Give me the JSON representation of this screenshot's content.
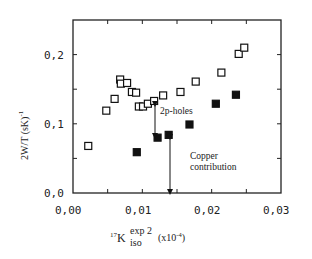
{
  "chart_data": {
    "type": "scatter",
    "title": "",
    "xlabel": "17K_iso^exp 2 (x10^-4)",
    "ylabel": "2W/T (sK)^-1",
    "xlim": [
      0.0,
      0.03
    ],
    "ylim": [
      0.0,
      0.25
    ],
    "x_ticks": [
      "0,00",
      "0,01",
      "0,02",
      "0,03"
    ],
    "y_ticks": [
      "0,0",
      "0,1",
      "0,2"
    ],
    "grid": false,
    "legend": null,
    "series": [
      {
        "name": "open squares",
        "marker": "open-square",
        "points": [
          [
            0.0022,
            0.068
          ],
          [
            0.0048,
            0.119
          ],
          [
            0.006,
            0.136
          ],
          [
            0.0068,
            0.164
          ],
          [
            0.0069,
            0.158
          ],
          [
            0.0078,
            0.159
          ],
          [
            0.0085,
            0.146
          ],
          [
            0.0091,
            0.145
          ],
          [
            0.0095,
            0.125
          ],
          [
            0.0101,
            0.125
          ],
          [
            0.0108,
            0.129
          ],
          [
            0.0117,
            0.133
          ],
          [
            0.013,
            0.141
          ],
          [
            0.0155,
            0.146
          ],
          [
            0.0177,
            0.161
          ],
          [
            0.0214,
            0.174
          ],
          [
            0.0239,
            0.201
          ],
          [
            0.0247,
            0.21
          ]
        ]
      },
      {
        "name": "filled squares",
        "marker": "filled-square",
        "points": [
          [
            0.0092,
            0.059
          ],
          [
            0.0122,
            0.08
          ],
          [
            0.0138,
            0.084
          ],
          [
            0.0168,
            0.099
          ],
          [
            0.0206,
            0.129
          ],
          [
            0.0235,
            0.142
          ]
        ]
      }
    ],
    "annotations": [
      {
        "text": "2p-holes",
        "arrow": {
          "x": 0.0118,
          "y_from": 0.132,
          "y_to": 0.082
        }
      },
      {
        "text": "Copper contribution",
        "lines": [
          "Copper",
          "contribution"
        ],
        "arrow": {
          "x": 0.014,
          "y_from": 0.083,
          "y_to": 0.0
        }
      }
    ]
  },
  "labels": {
    "x_ticks": [
      "0,00",
      "0,01",
      "0,02",
      "0,03"
    ],
    "y_ticks": [
      "0,0",
      "0,1",
      "0,2"
    ],
    "ylabel_main": "2W/T (sK)",
    "ylabel_sup": "-1",
    "xlabel_pre_sup": "17",
    "xlabel_main": "K",
    "xlabel_sup": "exp 2",
    "xlabel_sub": "iso",
    "xlabel_unit": "(x10",
    "xlabel_unit_sup": "-4",
    "xlabel_unit_close": ")",
    "annot_2p": "2p-holes",
    "annot_copper_1": "Copper",
    "annot_copper_2": "contribution"
  }
}
